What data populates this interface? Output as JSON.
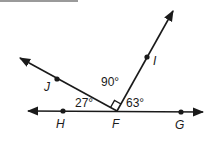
{
  "diagram": {
    "vertex": "F",
    "points": [
      {
        "name": "H",
        "on": "line"
      },
      {
        "name": "G",
        "on": "line"
      },
      {
        "name": "J",
        "on": "ray"
      },
      {
        "name": "I",
        "on": "ray"
      }
    ],
    "angles": {
      "HFJ": "27°",
      "JFI": "90°",
      "IFG": "63°"
    },
    "line_color": "#1a1a1a"
  }
}
